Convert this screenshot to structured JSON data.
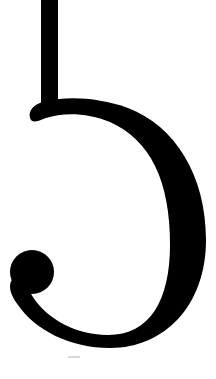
{
  "glyph": {
    "description": "Cropped black serif-style letterform: vertical stem joining a reversed-C bowl with a ball terminal",
    "fill": "#000000",
    "background": "#ffffff",
    "faint_mark_color": "#d8d8d8"
  }
}
